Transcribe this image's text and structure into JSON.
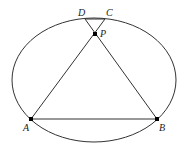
{
  "diagram": {
    "type": "geometry",
    "ellipse": {
      "cx": 94,
      "cy": 80,
      "rx": 82,
      "ry": 62
    },
    "points": {
      "D": {
        "label": "D",
        "x": 85,
        "y": 19
      },
      "C": {
        "label": "C",
        "x": 105,
        "y": 19
      },
      "P": {
        "label": "P",
        "x": 95,
        "y": 34
      },
      "A": {
        "label": "A",
        "x": 31,
        "y": 119
      },
      "B": {
        "label": "B",
        "x": 157,
        "y": 119
      }
    },
    "segments": [
      [
        "D",
        "C"
      ],
      [
        "D",
        "B"
      ],
      [
        "C",
        "A"
      ],
      [
        "A",
        "B"
      ]
    ],
    "colors": {
      "stroke": "#333333",
      "point": "#000000"
    }
  }
}
